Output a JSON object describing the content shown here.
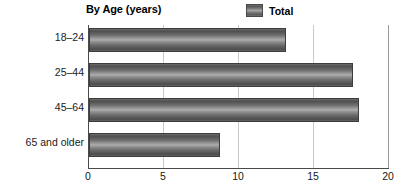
{
  "chart_data": {
    "type": "bar",
    "orientation": "horizontal",
    "title": "By Age (years)",
    "xlabel": "",
    "ylabel": "",
    "categories": [
      "18–24",
      "25–44",
      "45–64",
      "65 and older"
    ],
    "series": [
      {
        "name": "Total",
        "values": [
          13.1,
          17.6,
          18.0,
          8.7
        ]
      }
    ],
    "legend": {
      "position": "top-right",
      "entries": [
        {
          "label": "Total",
          "swatch_color": "#7a7a7a"
        }
      ]
    },
    "xlim": [
      0,
      20
    ],
    "xticks": [
      0,
      5,
      10,
      15,
      20
    ],
    "xtick_labels": [
      "0",
      "5",
      "10",
      "15",
      "20"
    ],
    "grid": "vertical",
    "colors": {
      "bar_dark": "#4d4d4d",
      "bar_light": "#adadad",
      "bar_border": "#3d3d3d",
      "gridline": "#c9c9c9",
      "axis": "#4a4a4a",
      "background": "#ffffff",
      "text": "#1a1a1a"
    }
  }
}
